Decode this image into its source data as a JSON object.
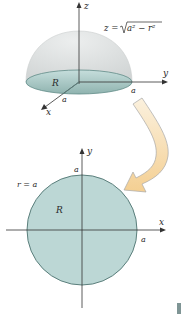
{
  "hemisphere": {
    "axis_z_label": "z",
    "axis_y_label": "y",
    "axis_x_label": "x",
    "equation_lhs": "z = ",
    "equation_radicand": "a² − r²",
    "region_label": "R",
    "radius_label_y": "a",
    "radius_label_x": "a"
  },
  "disk": {
    "axis_y_label": "y",
    "axis_x_label": "x",
    "top_label": "a",
    "right_label": "a",
    "boundary_label": "r = a",
    "region_label": "R"
  },
  "colors": {
    "dome": "#d8dcdc",
    "base": "#a9c9c6",
    "disk_fill": "#b9d6d4",
    "disk_stroke": "#5b7f7c",
    "arrow_fill": "#f6dcae",
    "arrow_stroke": "#9a9a9a",
    "axis": "#333333",
    "corner_mark": "#7f9595"
  }
}
